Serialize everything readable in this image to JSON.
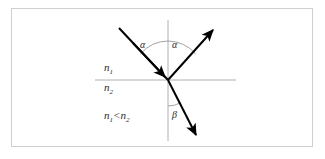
{
  "figure": {
    "type": "optics-refraction-reflection-diagram",
    "background_color": "#ffffff",
    "frame_border_color": "#cfcfcf",
    "ray_color": "#000000",
    "axis_color": "#b0b0b0",
    "label_color": "#2b2b2b"
  },
  "labels": {
    "medium_upper": "n",
    "medium_upper_sub": "1",
    "medium_lower": "n",
    "medium_lower_sub": "2",
    "inequality_left": "n",
    "inequality_left_sub": "1",
    "inequality_operator": "<",
    "inequality_right": "n",
    "inequality_right_sub": "2",
    "angle_incident": "α",
    "angle_reflected": "α",
    "angle_refracted": "β"
  },
  "geometry": {
    "interface_line": {
      "x1": 95,
      "y1": 80,
      "x2": 236,
      "y2": 80
    },
    "normal_line": {
      "x1": 168,
      "y1": 20,
      "x2": 168,
      "y2": 141
    },
    "origin": {
      "x": 168,
      "y": 80
    },
    "incident_ray": {
      "x1": 119,
      "y1": 28,
      "x2": 168,
      "y2": 80
    },
    "reflected_ray": {
      "x1": 168,
      "y1": 80,
      "x2": 215,
      "y2": 28
    },
    "refracted_ray": {
      "x1": 168,
      "y1": 80,
      "x2": 198,
      "y2": 138
    },
    "alpha_arc_radius": 36,
    "beta_arc_radius": 26
  }
}
